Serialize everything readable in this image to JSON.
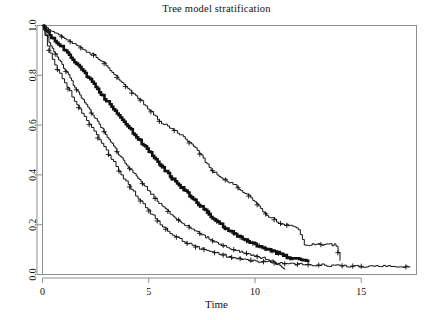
{
  "chart_data": {
    "type": "line",
    "title": "Tree model stratification",
    "subtitle": "",
    "xlabel": "Time",
    "ylabel": "",
    "xlim": [
      0,
      17.6
    ],
    "ylim": [
      0.0,
      1.0
    ],
    "xticks": [
      0,
      5,
      10,
      15
    ],
    "xtick_labels": [
      "0",
      "5",
      "10",
      "15"
    ],
    "yticks": [
      0.0,
      0.2,
      0.4,
      0.6,
      0.8,
      1.0
    ],
    "ytick_labels": [
      "0.0",
      "0.2",
      "0.4",
      "0.6",
      "0.8",
      "1.0"
    ],
    "grid": false,
    "legend": "none",
    "plot_kind": "kaplan-meier-survival",
    "n_series": 4,
    "series": [
      {
        "name": "group-1-best-survival",
        "stroke_width": 1.0,
        "censored_marks_x": [
          0.9,
          1.3,
          1.8,
          2.4,
          2.9,
          3.5,
          3.9,
          4.2,
          4.6,
          5.1,
          5.5,
          6.2,
          6.9,
          7.4,
          8.0,
          8.6,
          9.2,
          9.7,
          10.1,
          10.5,
          10.9,
          11.2,
          11.5,
          13.1,
          13.9
        ],
        "x": [
          0,
          0.2,
          0.4,
          0.6,
          0.8,
          1.0,
          1.3,
          1.6,
          1.9,
          2.2,
          2.5,
          2.8,
          3.1,
          3.4,
          3.7,
          4.0,
          4.3,
          4.6,
          4.9,
          5.2,
          5.5,
          5.8,
          6.1,
          6.4,
          6.7,
          7.0,
          7.3,
          7.6,
          7.9,
          8.2,
          8.5,
          8.8,
          9.1,
          9.4,
          9.7,
          10.0,
          10.3,
          10.6,
          10.9,
          11.2,
          11.6,
          12.0,
          12.3,
          13.0,
          13.8,
          14.0
        ],
        "y": [
          1.0,
          0.99,
          0.98,
          0.97,
          0.96,
          0.95,
          0.935,
          0.92,
          0.905,
          0.89,
          0.875,
          0.855,
          0.83,
          0.8,
          0.775,
          0.745,
          0.72,
          0.7,
          0.67,
          0.645,
          0.615,
          0.6,
          0.585,
          0.565,
          0.545,
          0.52,
          0.495,
          0.46,
          0.425,
          0.4,
          0.385,
          0.37,
          0.355,
          0.335,
          0.315,
          0.29,
          0.26,
          0.235,
          0.22,
          0.205,
          0.195,
          0.19,
          0.12,
          0.12,
          0.12,
          0.055
        ]
      },
      {
        "name": "group-2-thick-middle",
        "stroke_width": 2.6,
        "censored_marks_x": [
          5.6,
          6.1,
          6.6,
          7.0,
          7.4,
          7.8,
          8.2,
          8.6,
          9.0,
          9.3,
          9.6,
          9.9,
          10.2,
          10.5,
          10.8,
          11.1,
          11.5
        ],
        "x": [
          0,
          0.2,
          0.4,
          0.6,
          0.9,
          1.2,
          1.5,
          1.8,
          2.1,
          2.4,
          2.7,
          3.0,
          3.3,
          3.6,
          3.9,
          4.2,
          4.5,
          4.8,
          5.1,
          5.4,
          5.7,
          6.0,
          6.3,
          6.6,
          6.9,
          7.2,
          7.5,
          7.8,
          8.1,
          8.4,
          8.7,
          9.0,
          9.3,
          9.6,
          9.9,
          10.2,
          10.5,
          10.8,
          11.1,
          11.4,
          11.7,
          12.0,
          12.3,
          12.5
        ],
        "y": [
          1.0,
          0.975,
          0.955,
          0.94,
          0.915,
          0.885,
          0.855,
          0.825,
          0.795,
          0.765,
          0.73,
          0.7,
          0.67,
          0.64,
          0.605,
          0.575,
          0.545,
          0.515,
          0.485,
          0.455,
          0.425,
          0.395,
          0.37,
          0.345,
          0.32,
          0.295,
          0.27,
          0.245,
          0.22,
          0.2,
          0.18,
          0.165,
          0.15,
          0.135,
          0.125,
          0.115,
          0.105,
          0.095,
          0.085,
          0.075,
          0.065,
          0.06,
          0.055,
          0.05
        ]
      },
      {
        "name": "group-3-lower-middle",
        "stroke_width": 1.0,
        "censored_marks_x": [
          0.6,
          1.1,
          1.6,
          2.3,
          2.9,
          3.5,
          4.1,
          4.7,
          5.3,
          5.9,
          6.4,
          6.9,
          7.4,
          8.0,
          8.5,
          9.0,
          9.6,
          10.1
        ],
        "x": [
          0,
          0.2,
          0.4,
          0.6,
          0.9,
          1.2,
          1.5,
          1.8,
          2.1,
          2.4,
          2.7,
          3.0,
          3.3,
          3.6,
          3.9,
          4.2,
          4.5,
          4.8,
          5.1,
          5.4,
          5.7,
          6.0,
          6.3,
          6.6,
          6.9,
          7.2,
          7.5,
          7.8,
          8.1,
          8.4,
          8.7,
          9.0,
          9.3,
          9.6,
          9.9,
          10.2,
          10.6,
          11.0,
          11.4
        ],
        "y": [
          1.0,
          0.955,
          0.915,
          0.885,
          0.845,
          0.8,
          0.755,
          0.715,
          0.675,
          0.635,
          0.6,
          0.56,
          0.52,
          0.48,
          0.445,
          0.415,
          0.385,
          0.355,
          0.325,
          0.295,
          0.27,
          0.245,
          0.225,
          0.205,
          0.19,
          0.175,
          0.16,
          0.145,
          0.13,
          0.12,
          0.11,
          0.1,
          0.09,
          0.085,
          0.075,
          0.07,
          0.06,
          0.045,
          0.02
        ]
      },
      {
        "name": "group-4-worst-survival",
        "stroke_width": 1.0,
        "censored_marks_x": [
          0.3,
          0.7,
          1.2,
          1.7,
          2.2,
          2.6,
          3.1,
          3.6,
          4.1,
          4.6,
          5.0,
          5.4,
          5.8,
          6.3,
          6.8,
          7.2,
          7.6,
          8.1,
          8.5,
          8.9,
          9.3,
          9.8,
          10.4,
          10.9,
          11.4,
          12.0,
          12.5,
          13.0,
          14.1,
          14.6,
          15.0,
          17.1
        ],
        "x": [
          0,
          0.2,
          0.4,
          0.6,
          0.9,
          1.2,
          1.5,
          1.8,
          2.1,
          2.4,
          2.7,
          3.0,
          3.3,
          3.6,
          3.9,
          4.2,
          4.5,
          4.8,
          5.1,
          5.4,
          5.7,
          6.0,
          6.4,
          6.8,
          7.2,
          7.6,
          8.0,
          8.4,
          8.8,
          9.2,
          9.6,
          10.0,
          10.5,
          11.0,
          11.6,
          12.2,
          13.0,
          14.0,
          15.0,
          16.0,
          17.3
        ],
        "y": [
          1.0,
          0.925,
          0.875,
          0.84,
          0.79,
          0.745,
          0.7,
          0.655,
          0.615,
          0.575,
          0.535,
          0.495,
          0.455,
          0.415,
          0.375,
          0.34,
          0.305,
          0.275,
          0.245,
          0.215,
          0.19,
          0.165,
          0.145,
          0.125,
          0.11,
          0.1,
          0.09,
          0.08,
          0.07,
          0.065,
          0.06,
          0.055,
          0.05,
          0.045,
          0.042,
          0.04,
          0.038,
          0.035,
          0.033,
          0.032,
          0.03
        ]
      }
    ]
  },
  "figure": {
    "title": "Tree model stratification",
    "xlabel": "Time",
    "background_color": "#ffffff",
    "frame_color": "#8e8e8e",
    "curve_color": "#111111"
  }
}
